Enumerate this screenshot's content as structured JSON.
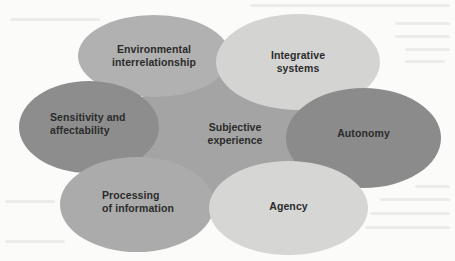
{
  "diagram": {
    "center": {
      "label": "Subjective\nexperience",
      "color": "#a4a4a4"
    },
    "nodes": [
      {
        "id": "environmental",
        "label": "Environmental\ninterrelationship",
        "color": "#b1b1b1"
      },
      {
        "id": "integrative",
        "label": "Integrative\nsystems",
        "color": "#d4d4d3"
      },
      {
        "id": "sensitivity",
        "label": "Sensitivity and\naffectability",
        "color": "#8d8d8d"
      },
      {
        "id": "autonomy",
        "label": "Autonomy",
        "color": "#8b8b8b"
      },
      {
        "id": "processing",
        "label": "Processing\nof information",
        "color": "#ababab"
      },
      {
        "id": "agency",
        "label": "Agency",
        "color": "#d6d6d5"
      }
    ]
  }
}
